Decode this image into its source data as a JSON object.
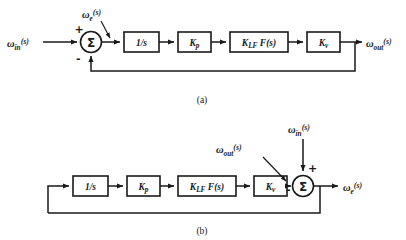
{
  "figure": {
    "background_color": "#ffffff",
    "line_color": "#1a1a1a"
  },
  "diagrams": [
    {
      "id": "a",
      "caption": "(a)",
      "input_label": {
        "base": "ω",
        "sub": "in",
        "sup": "(s)"
      },
      "output_label": {
        "base": "ω",
        "sub": "out",
        "sup": "(s)"
      },
      "node_label": {
        "base": "ω",
        "sub": "e",
        "sup": "(s)"
      },
      "summer": {
        "glyph": "Σ",
        "plus": "+",
        "minus": "-"
      },
      "blocks": [
        {
          "name": "integrator",
          "text": "1/s"
        },
        {
          "name": "phase-gain",
          "base": "K",
          "sub": "p"
        },
        {
          "name": "loop-filter",
          "base": "K",
          "sub": "LF",
          "tail": "F(s)"
        },
        {
          "name": "vco-gain",
          "base": "K",
          "sub": "v"
        }
      ]
    },
    {
      "id": "b",
      "caption": "(b)",
      "input_label": {
        "base": "ω",
        "sub": "in",
        "sup": "(s)"
      },
      "output_label": {
        "base": "ω",
        "sub": "e",
        "sup": "(s)"
      },
      "node_label": {
        "base": "ω",
        "sub": "out",
        "sup": "(s)"
      },
      "summer": {
        "glyph": "Σ",
        "plus": "+",
        "minus": "-"
      },
      "blocks": [
        {
          "name": "integrator",
          "text": "1/s"
        },
        {
          "name": "phase-gain",
          "base": "K",
          "sub": "p"
        },
        {
          "name": "loop-filter",
          "base": "K",
          "sub": "LF",
          "tail": "F(s)"
        },
        {
          "name": "vco-gain",
          "base": "K",
          "sub": "v"
        }
      ]
    }
  ]
}
